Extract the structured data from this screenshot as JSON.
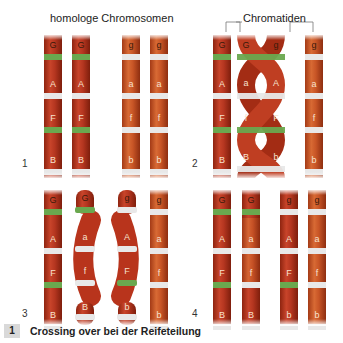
{
  "titles": {
    "homologous": "homologe Chromosomen",
    "chromatids": "Chromatiden"
  },
  "panels": [
    {
      "number": "1"
    },
    {
      "number": "2"
    },
    {
      "number": "3"
    },
    {
      "number": "4"
    }
  ],
  "caption": {
    "number": "1",
    "text": "Crossing over bei der Reifeteilung"
  },
  "colors": {
    "chromatid_dark": "#b8341c",
    "chromatid_light": "#c9562a",
    "band_green": "#6aa84f",
    "band_white": "#e8e8e8",
    "label_dark": "#3a1a0a",
    "label_light": "#f6e3cf"
  },
  "chromosomes": {
    "panel1": [
      {
        "genes": [
          "G",
          "A",
          "F",
          "B"
        ],
        "bands": [
          "green",
          "white",
          "green",
          "white"
        ],
        "shade": "dark"
      },
      {
        "genes": [
          "G",
          "A",
          "F",
          "B"
        ],
        "bands": [
          "green",
          "white",
          "green",
          "white"
        ],
        "shade": "dark"
      },
      {
        "genes": [
          "g",
          "a",
          "f",
          "b"
        ],
        "bands": [
          "white",
          "white",
          "white",
          "white"
        ],
        "shade": "light"
      },
      {
        "genes": [
          "g",
          "a",
          "f",
          "b"
        ],
        "bands": [
          "white",
          "white",
          "white",
          "white"
        ],
        "shade": "light"
      }
    ],
    "panel2": [
      {
        "genes": [
          "G",
          "A",
          "F",
          "B"
        ],
        "bands": [
          "green",
          "white",
          "green",
          "white"
        ],
        "shade": "dark"
      },
      {
        "genes": [
          "G",
          "a",
          "f",
          "B"
        ],
        "bands": [
          "green",
          "white",
          "green",
          "white"
        ],
        "shade": "dark"
      },
      {
        "genes": [
          "g",
          "A",
          "F",
          "b"
        ],
        "bands": [
          "green",
          "white",
          "green",
          "white"
        ],
        "shade": "dark"
      },
      {
        "genes": [
          "g",
          "a",
          "f",
          "b"
        ],
        "bands": [
          "white",
          "white",
          "white",
          "white"
        ],
        "shade": "light"
      }
    ],
    "panel3": [
      {
        "genes": [
          "G",
          "A",
          "F",
          "B"
        ],
        "bands": [
          "green",
          "white",
          "green",
          "white"
        ],
        "shade": "dark"
      },
      {
        "genes": [
          "G",
          "a",
          "f",
          "B"
        ],
        "bands": [
          "green",
          "white",
          "white",
          "white"
        ],
        "shade": "dark"
      },
      {
        "genes": [
          "g",
          "A",
          "F",
          "b"
        ],
        "bands": [
          "white",
          "white",
          "green",
          "white"
        ],
        "shade": "dark"
      },
      {
        "genes": [
          "g",
          "a",
          "f",
          "b"
        ],
        "bands": [
          "white",
          "white",
          "white",
          "white"
        ],
        "shade": "light"
      }
    ],
    "panel4": [
      {
        "genes": [
          "G",
          "A",
          "F",
          "B"
        ],
        "bands": [
          "green",
          "white",
          "green",
          "white"
        ],
        "shade": "dark"
      },
      {
        "genes": [
          "G",
          "a",
          "f",
          "B"
        ],
        "bands": [
          "green",
          "white",
          "white",
          "white"
        ],
        "shade": "mixed"
      },
      {
        "genes": [
          "g",
          "A",
          "F",
          "b"
        ],
        "bands": [
          "white",
          "white",
          "green",
          "white"
        ],
        "shade": "mixed"
      },
      {
        "genes": [
          "g",
          "a",
          "f",
          "b"
        ],
        "bands": [
          "white",
          "white",
          "white",
          "white"
        ],
        "shade": "light"
      }
    ]
  }
}
